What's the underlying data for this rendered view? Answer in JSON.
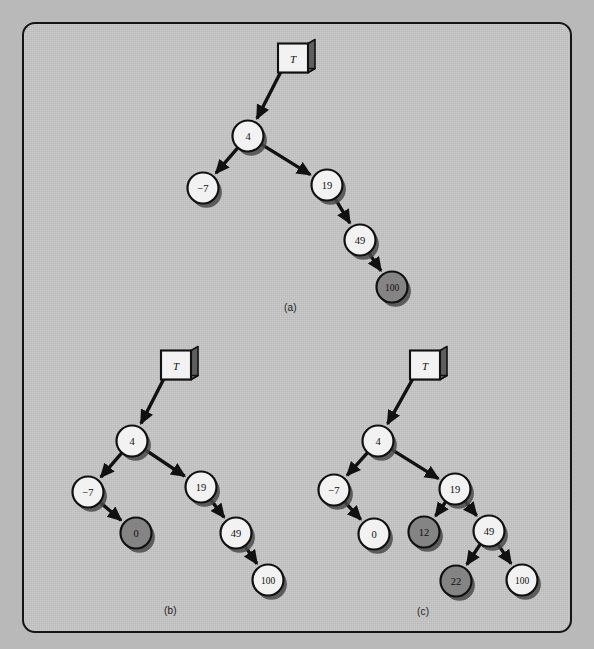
{
  "figure": {
    "background_color": "#c6c6c6",
    "node_light_color": "#f2f2f2",
    "node_shaded_color": "#848484",
    "outline_color": "#111111",
    "panels": [
      {
        "id": "a",
        "caption": "(a)",
        "caption_pos": [
          292,
          308
        ],
        "root_box": {
          "label": "T",
          "x": 293,
          "y": 58
        },
        "nodes": [
          {
            "id": "a4",
            "label": "4",
            "x": 248,
            "y": 136,
            "shaded": false
          },
          {
            "id": "am7",
            "label": "−7",
            "x": 203,
            "y": 188,
            "shaded": false
          },
          {
            "id": "a19",
            "label": "19",
            "x": 327,
            "y": 185,
            "shaded": false
          },
          {
            "id": "a49",
            "label": "49",
            "x": 360,
            "y": 240,
            "shaded": false
          },
          {
            "id": "a100",
            "label": "100",
            "x": 392,
            "y": 287,
            "shaded": true
          }
        ],
        "edges": [
          {
            "from": "box",
            "to": "a4"
          },
          {
            "from": "a4",
            "to": "am7"
          },
          {
            "from": "a4",
            "to": "a19"
          },
          {
            "from": "a19",
            "to": "a49"
          },
          {
            "from": "a49",
            "to": "a100"
          }
        ]
      },
      {
        "id": "b",
        "caption": "(b)",
        "caption_pos": [
          172,
          611
        ],
        "root_box": {
          "label": "T",
          "x": 176,
          "y": 365
        },
        "nodes": [
          {
            "id": "b4",
            "label": "4",
            "x": 132,
            "y": 441,
            "shaded": false
          },
          {
            "id": "bm7",
            "label": "−7",
            "x": 88,
            "y": 492,
            "shaded": false
          },
          {
            "id": "b0",
            "label": "0",
            "x": 136,
            "y": 533,
            "shaded": true
          },
          {
            "id": "b19",
            "label": "19",
            "x": 201,
            "y": 487,
            "shaded": false
          },
          {
            "id": "b49",
            "label": "49",
            "x": 236,
            "y": 533,
            "shaded": false
          },
          {
            "id": "b100",
            "label": "100",
            "x": 268,
            "y": 580,
            "shaded": false
          }
        ],
        "edges": [
          {
            "from": "box",
            "to": "b4"
          },
          {
            "from": "b4",
            "to": "bm7"
          },
          {
            "from": "b4",
            "to": "b19"
          },
          {
            "from": "bm7",
            "to": "b0"
          },
          {
            "from": "b19",
            "to": "b49"
          },
          {
            "from": "b49",
            "to": "b100"
          }
        ]
      },
      {
        "id": "c",
        "caption": "(c)",
        "caption_pos": [
          425,
          612
        ],
        "root_box": {
          "label": "T",
          "x": 425,
          "y": 365
        },
        "nodes": [
          {
            "id": "c4",
            "label": "4",
            "x": 378,
            "y": 441,
            "shaded": false
          },
          {
            "id": "cm7",
            "label": "−7",
            "x": 334,
            "y": 490,
            "shaded": false
          },
          {
            "id": "c0",
            "label": "0",
            "x": 374,
            "y": 534,
            "shaded": false
          },
          {
            "id": "c19",
            "label": "19",
            "x": 455,
            "y": 489,
            "shaded": false
          },
          {
            "id": "c12",
            "label": "12",
            "x": 424,
            "y": 532,
            "shaded": true
          },
          {
            "id": "c49",
            "label": "49",
            "x": 489,
            "y": 531,
            "shaded": false
          },
          {
            "id": "c22",
            "label": "22",
            "x": 456,
            "y": 581,
            "shaded": true
          },
          {
            "id": "c100",
            "label": "100",
            "x": 522,
            "y": 580,
            "shaded": false
          }
        ],
        "edges": [
          {
            "from": "box",
            "to": "c4"
          },
          {
            "from": "c4",
            "to": "cm7"
          },
          {
            "from": "c4",
            "to": "c19"
          },
          {
            "from": "cm7",
            "to": "c0"
          },
          {
            "from": "c19",
            "to": "c12"
          },
          {
            "from": "c19",
            "to": "c49"
          },
          {
            "from": "c49",
            "to": "c22"
          },
          {
            "from": "c49",
            "to": "c100"
          }
        ]
      }
    ]
  }
}
